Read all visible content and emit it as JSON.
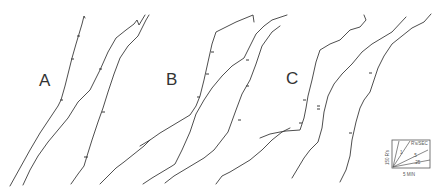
{
  "figure": {
    "panels": [
      {
        "label": "A"
      },
      {
        "label": "B"
      },
      {
        "label": "C"
      }
    ],
    "scale_key": {
      "vertical_label": "150 R's",
      "horizontal_label": "5 MIN",
      "rate_label": "R's/SEC",
      "slope_labels": [
        "1",
        ".5",
        ".25"
      ]
    }
  },
  "colors": {
    "trace": "#3a3a3a",
    "background": "#ffffff"
  }
}
